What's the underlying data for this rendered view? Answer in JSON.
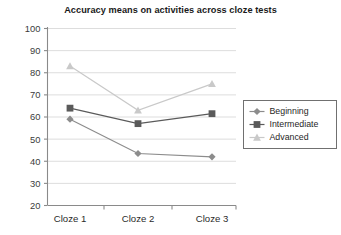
{
  "chart_data": {
    "type": "line",
    "title": "Accuracy means on activities across cloze tests",
    "xlabel": "",
    "ylabel": "",
    "categories": [
      "Cloze 1",
      "Cloze 2",
      "Cloze 3"
    ],
    "ylim": [
      20,
      100
    ],
    "ytick_step": 10,
    "yticks": [
      100,
      90,
      80,
      70,
      60,
      50,
      40,
      30,
      20
    ],
    "grid": true,
    "legend_position": "right-middle",
    "series": [
      {
        "name": "Beginning",
        "marker": "diamond",
        "color": "#8c8c8c",
        "values": [
          59,
          43.5,
          42
        ]
      },
      {
        "name": "Intermediate",
        "marker": "square",
        "color": "#5a5a5a",
        "values": [
          64,
          57,
          61.5
        ]
      },
      {
        "name": "Advanced",
        "marker": "triangle",
        "color": "#c9c9c9",
        "values": [
          83,
          63,
          75
        ]
      }
    ]
  },
  "legend": {
    "items": [
      {
        "label": "Beginning"
      },
      {
        "label": "Intermediate"
      },
      {
        "label": "Advanced"
      }
    ]
  },
  "axis": {
    "y_tick_labels": [
      "100",
      "90",
      "80",
      "70",
      "60",
      "50",
      "40",
      "30",
      "20"
    ],
    "x_tick_labels": [
      "Cloze 1",
      "Cloze 2",
      "Cloze 3"
    ]
  }
}
